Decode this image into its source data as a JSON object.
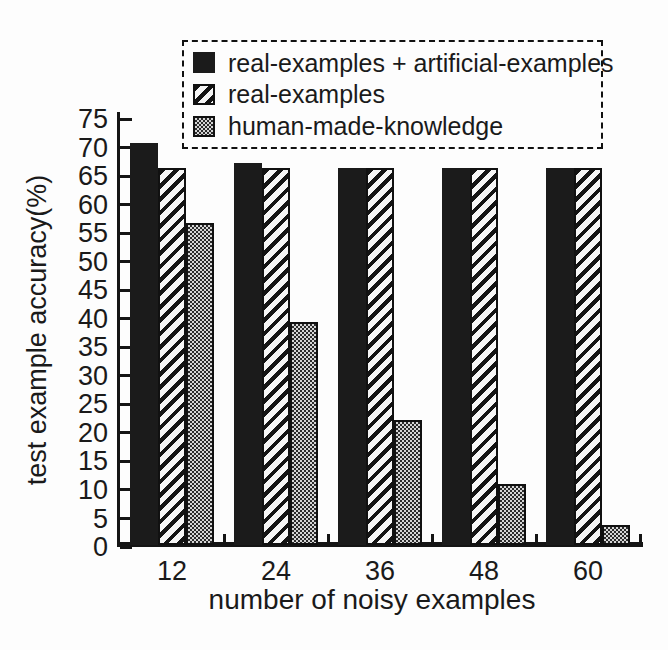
{
  "figure": {
    "background": "#fdfdfd",
    "ink_color": "#1a1a1a",
    "legend_border_style": "dashed"
  },
  "chart_data": {
    "type": "bar",
    "title": "",
    "xlabel": "number of noisy examples",
    "ylabel": "test example accuracy(%)",
    "categories": [
      "12",
      "24",
      "36",
      "48",
      "60"
    ],
    "series": [
      {
        "name": "real-examples + artificial-examples",
        "pattern": "solid",
        "values": [
          70.5,
          67,
          66,
          66,
          66
        ]
      },
      {
        "name": "real-examples",
        "pattern": "hatch",
        "values": [
          66,
          66,
          66,
          66,
          66
        ]
      },
      {
        "name": "human-made-knowledge",
        "pattern": "dots",
        "values": [
          56.5,
          39,
          22,
          10.7,
          3.5
        ]
      }
    ],
    "ylim": [
      0,
      75
    ],
    "ytick_step": 5,
    "ytick_labels": [
      "0",
      "5",
      "10",
      "15",
      "20",
      "25",
      "30",
      "35",
      "40",
      "45",
      "50",
      "55",
      "60",
      "65",
      "70",
      "75"
    ],
    "grid": false,
    "legend_position": "top-center",
    "legend_border": "dashed",
    "bar_colors": {
      "solid": "#1b1b1b",
      "hatch_ink": "#141414",
      "dots_ink": "#2b2b2b"
    }
  }
}
